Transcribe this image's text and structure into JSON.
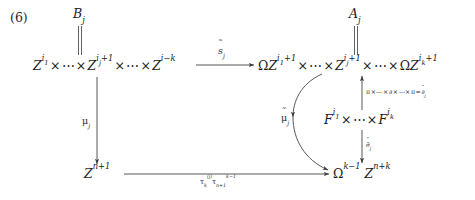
{
  "equation": {
    "number": "(6)"
  },
  "nodes": {
    "top_left": "B",
    "top_left_sub": "j",
    "top_right": "A",
    "top_right_sub": "j",
    "upper_left_product": "Z^{i_1} × ⋯ × Z^{i_j+1} × ⋯ × Z^{i-k}",
    "upper_right_product": "ΩZ^{i_1+1} × ⋯ × Z^{i_j+1} × ⋯ × ΩZ^{i_k+1}",
    "middle_right_product": "F^{i_1} × ⋯ × F^{i_k}",
    "lower_left": "Z^{n+1}",
    "lower_right": "Ω^{k-1} Z^{n+k}"
  },
  "arrow_labels": {
    "top_horizontal": "s̃_j",
    "left_vertical": "μ_j",
    "curved_diagonal": "μ̃_j",
    "right_vertical_up": "π × ⋯ × ∂ × ⋯ × π = ∂̄_j",
    "right_vertical_down": "∂̄_j",
    "bottom_horizontal": "τ_k^{(j)} τ_{n+1}^{k-1}"
  },
  "colors": {
    "ink": "#1b1b1b",
    "stroke": "#3a3a3a",
    "background": "#ffffff"
  }
}
